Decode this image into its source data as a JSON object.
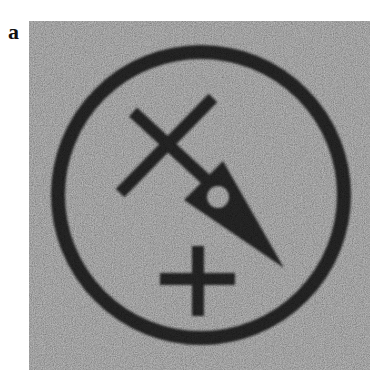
{
  "panel": {
    "label": "a"
  },
  "figure": {
    "colors": {
      "background": "#a0a0a0",
      "foreground": "#232323",
      "page": "#ffffff"
    },
    "shapes": {
      "ring": {
        "cx": 172,
        "cy": 174,
        "r": 143,
        "stroke_width": 14
      },
      "cross_long": {
        "x1": 104,
        "y1": 91,
        "x2": 198,
        "y2": 178,
        "width": 12
      },
      "cross_short": {
        "x1": 184,
        "y1": 77,
        "x2": 91,
        "y2": 172,
        "width": 12
      },
      "wedge": {
        "points": "194,140 155,179 255,247",
        "hole": {
          "cx": 189,
          "cy": 176,
          "r": 11
        }
      },
      "plus_vertical": {
        "x": 163,
        "y": 225,
        "w": 12,
        "h": 70
      },
      "plus_horizontal": {
        "x": 131,
        "y": 252,
        "w": 75,
        "h": 12
      }
    }
  }
}
